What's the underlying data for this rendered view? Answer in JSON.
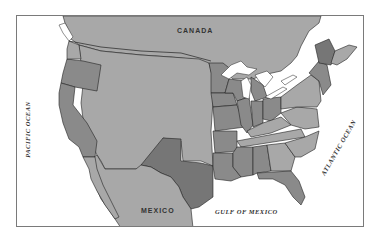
{
  "map": {
    "type": "political outline map",
    "region": "United States with surrounding areas",
    "colors": {
      "water": "#ffffff",
      "light_region": "#a8a8a8",
      "medium_region": "#8c8c8c",
      "dark_region": "#767676",
      "border": "#222222",
      "frame": "#7a7a7a"
    },
    "labels": {
      "canada": "CANADA",
      "mexico": "MEXICO",
      "pacific": "PACIFIC OCEAN",
      "atlantic": "ATLANTIC OCEAN",
      "gulf": "GULF OF MEXICO"
    },
    "highlighted_regions": [
      "Oregon",
      "California",
      "Texas",
      "Minnesota",
      "Iowa",
      "Missouri",
      "Arkansas",
      "Louisiana",
      "Mississippi",
      "Alabama",
      "Florida",
      "Illinois",
      "Wisconsin",
      "Michigan",
      "Indiana",
      "Ohio",
      "Maine",
      "Kentucky",
      "Tennessee",
      "New England"
    ]
  }
}
